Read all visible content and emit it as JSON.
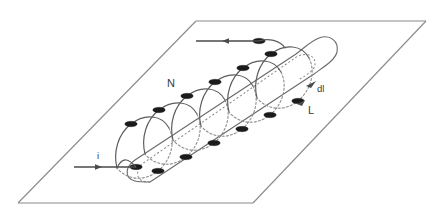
{
  "figure": {
    "type": "physics-diagram",
    "background_color": "#ffffff",
    "line_color": "#5b5b5b",
    "plane_color": "#8a8a8a",
    "marker_color": "#1b1b1b",
    "dashed_color": "#8d8d8d"
  },
  "labels": {
    "turns": "N",
    "length": "L",
    "element": "dl",
    "current": "i"
  },
  "geometry": {
    "plane": {
      "top_left": [
        196,
        21
      ],
      "top_right": [
        426,
        21
      ],
      "bottom_right": [
        253,
        203
      ],
      "bottom_left": [
        18,
        203
      ]
    },
    "coil_turns": 6,
    "marker_count": 12,
    "solenoid_axis_start": [
      150,
      160
    ],
    "solenoid_axis_end": [
      320,
      55
    ]
  },
  "annotations": {
    "turns_label_pos": [
      176,
      83
    ],
    "length_label_pos": [
      311,
      112
    ],
    "element_label_pos": [
      319,
      89
    ],
    "current_label_pos": [
      98,
      157
    ]
  }
}
